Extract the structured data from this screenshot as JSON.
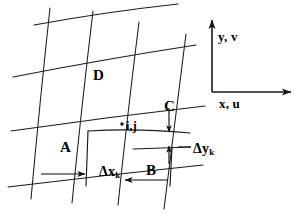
{
  "figure": {
    "background_color": "#ffffff",
    "line_color": "#1a1a1a",
    "text_color": "#000000",
    "width": 307,
    "height": 215
  },
  "cell_labels": {
    "a": "A",
    "b": "B",
    "c": "C",
    "d": "D"
  },
  "node_label": {
    "indices": "i,j",
    "marker": "node-dot"
  },
  "dimensions": {
    "dx": {
      "symbol": "Δx",
      "subscript": "k"
    },
    "dy": {
      "symbol": "Δy",
      "subscript": "k"
    }
  },
  "axes": {
    "vertical": "y, v",
    "horizontal": "x, u"
  },
  "icons": {
    "arrow_up": "arrow-up-icon",
    "arrow_right": "arrow-right-icon",
    "arrow_down": "arrow-down-icon",
    "arrow_left": "arrow-left-icon"
  }
}
